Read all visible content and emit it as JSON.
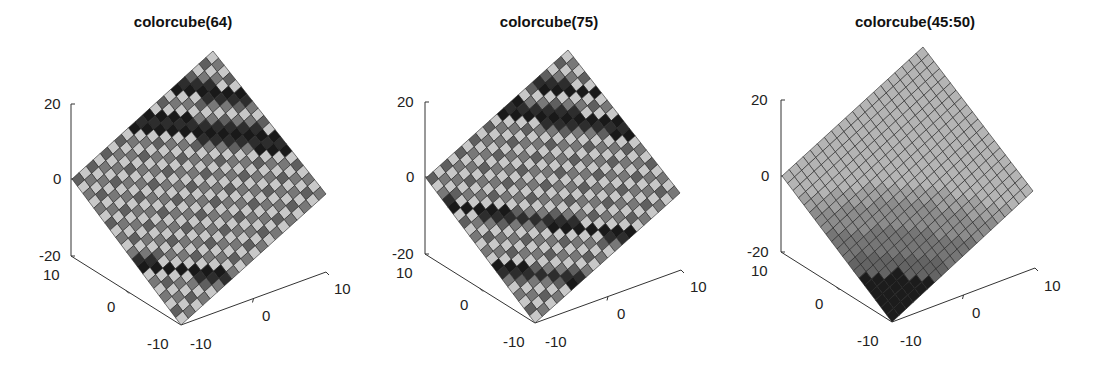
{
  "chart_data": [
    {
      "type": "surface",
      "title": "colorcube(64)",
      "colormap": "colorcube",
      "colormap_arg": "64",
      "grid": {
        "x": [
          -10,
          10
        ],
        "y": [
          -10,
          10
        ],
        "cells": 20
      },
      "zlim": [
        -20,
        20
      ],
      "ztick_labels": [
        "20",
        "0",
        "-20"
      ],
      "xtick_labels": [
        "-10",
        "0",
        "10"
      ],
      "ytick_labels": [
        "10",
        "0",
        "-10"
      ],
      "view": "rotated diamond (surface seen from above-front)",
      "geom": {
        "offset_x": 0,
        "top": [
          213,
          51
        ],
        "left": [
          72,
          179
        ],
        "right": [
          326,
          194
        ],
        "bottom": [
          181,
          325
        ],
        "zaxis": {
          "x": 71,
          "y20": 104,
          "y0": 179,
          "ym20": 256
        },
        "yaxis_end": [
          71,
          256
        ],
        "xaxis_end": [
          326,
          272
        ],
        "origin": [
          181,
          325
        ]
      },
      "bands": "repeating colorcube cycle producing checkered light/mid/dark gray cells with dark black bands near top"
    },
    {
      "type": "surface",
      "title": "colorcube(75)",
      "colormap": "colorcube",
      "colormap_arg": "75",
      "grid": {
        "x": [
          -10,
          10
        ],
        "y": [
          -10,
          10
        ],
        "cells": 20
      },
      "zlim": [
        -20,
        20
      ],
      "ztick_labels": [
        "20",
        "0",
        "-20"
      ],
      "xtick_labels": [
        "-10",
        "0",
        "10"
      ],
      "ytick_labels": [
        "10",
        "0",
        "-10"
      ],
      "view": "rotated diamond",
      "geom": {
        "offset_x": 366,
        "top": [
          568,
          50
        ],
        "left": [
          426,
          178
        ],
        "right": [
          680,
          193
        ],
        "bottom": [
          535,
          323
        ],
        "zaxis": {
          "x": 425,
          "y20": 102,
          "y0": 177,
          "ym20": 254
        },
        "yaxis_end": [
          425,
          254
        ],
        "xaxis_end": [
          681,
          270
        ],
        "origin": [
          535,
          323
        ]
      },
      "bands": "repeating colorcube cycle with denser dark bands"
    },
    {
      "type": "surface",
      "title": "colorcube(45:50)",
      "colormap": "colorcube",
      "colormap_arg": "45:50",
      "grid": {
        "x": [
          -10,
          10
        ],
        "y": [
          -10,
          10
        ],
        "cells": 20
      },
      "zlim": [
        -20,
        20
      ],
      "ztick_labels": [
        "20",
        "0",
        "-20"
      ],
      "xtick_labels": [
        "-10",
        "0",
        "10"
      ],
      "ytick_labels": [
        "10",
        "0",
        "-10"
      ],
      "view": "rotated diamond",
      "geom": {
        "offset_x": 732,
        "top": [
          923,
          47
        ],
        "left": [
          782,
          176
        ],
        "right": [
          1033,
          191
        ],
        "bottom": [
          892,
          322
        ],
        "zaxis": {
          "x": 781,
          "y20": 100,
          "y0": 176,
          "ym20": 252
        },
        "yaxis_end": [
          781,
          252
        ],
        "xaxis_end": [
          1035,
          268
        ],
        "origin": [
          892,
          322
        ]
      },
      "bands": "six smooth gray levels: light gray top half, mid grays, black at bottom corner"
    }
  ],
  "panels": [
    {
      "title": "colorcube(64)"
    },
    {
      "title": "colorcube(75)"
    },
    {
      "title": "colorcube(45:50)"
    }
  ],
  "ticks": {
    "z20": "20",
    "z0": "0",
    "zm20": "-20",
    "y10": "10",
    "y0": "0",
    "ym10": "-10",
    "x10": "10",
    "x0": "0",
    "xm10": "-10"
  }
}
